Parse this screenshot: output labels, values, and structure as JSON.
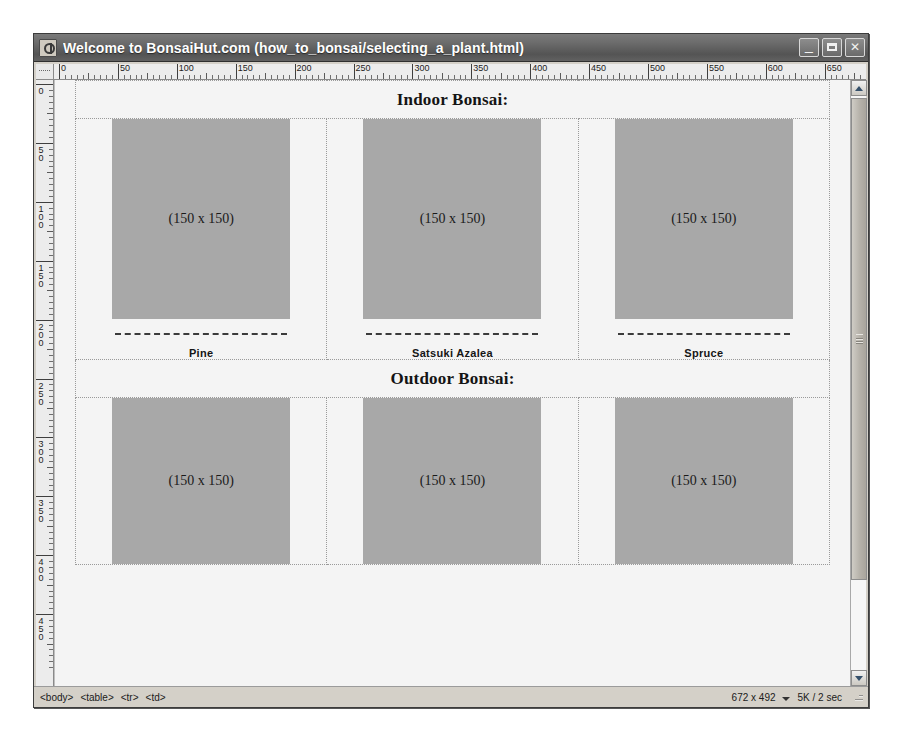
{
  "window": {
    "title": "Welcome to BonsaiHut.com (how_to_bonsai/selecting_a_plant.html)",
    "icon": "document-icon",
    "minimize_label": "_",
    "maximize_label": "",
    "close_label": "✕"
  },
  "rulers": {
    "horizontal": {
      "labels": [
        "0",
        "50",
        "100",
        "150",
        "200",
        "250",
        "300",
        "350",
        "400",
        "450",
        "500",
        "550",
        "600",
        "650"
      ],
      "step": 50,
      "unit": "px"
    },
    "vertical": {
      "labels": [
        "0",
        "50",
        "100",
        "150",
        "200",
        "250",
        "300",
        "350",
        "400",
        "450"
      ],
      "step": 50,
      "unit": "px"
    }
  },
  "document": {
    "sections": [
      {
        "heading": "Indoor Bonsai:",
        "items": [
          {
            "placeholder": "(150 x 150)",
            "name": "Pine"
          },
          {
            "placeholder": "(150 x 150)",
            "name": "Satsuki Azalea"
          },
          {
            "placeholder": "(150 x 150)",
            "name": "Spruce"
          }
        ]
      },
      {
        "heading": "Outdoor Bonsai:",
        "items": [
          {
            "placeholder": "(150 x 150)",
            "name": ""
          },
          {
            "placeholder": "(150 x 150)",
            "name": ""
          },
          {
            "placeholder": "(150 x 150)",
            "name": ""
          }
        ]
      }
    ],
    "placeholder_color": "#a8a8a8"
  },
  "statusbar": {
    "tags": [
      "<body>",
      "<table>",
      "<tr>",
      "<td>"
    ],
    "dimensions": "672 x 492",
    "download_size": "5K / 2 sec"
  },
  "scrollbar": {
    "up_arrow": "scroll-up-icon",
    "down_arrow": "scroll-down-icon"
  }
}
